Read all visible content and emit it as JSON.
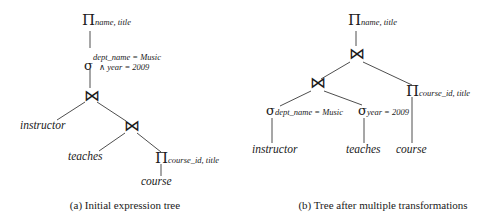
{
  "figure": {
    "background_color": "#ffffff",
    "ink_color": "#1a1a1a"
  },
  "trees": [
    {
      "id": "a",
      "caption": "(a) Initial expression tree",
      "nodes": [
        {
          "name": "project-name-title",
          "operator": "Π",
          "subscript": "name, title"
        },
        {
          "name": "select-conjunction",
          "operator": "σ",
          "subscript_line1": "dept_name = Music",
          "subscript_line2": "∧ year = 2009"
        },
        {
          "name": "join-upper",
          "operator": "⋈",
          "subscript": ""
        },
        {
          "name": "join-lower",
          "operator": "⋈",
          "subscript": ""
        },
        {
          "name": "relation-instructor",
          "label": "instructor"
        },
        {
          "name": "relation-teaches",
          "label": "teaches"
        },
        {
          "name": "project-course-id-title",
          "operator": "Π",
          "subscript": "course_id, title"
        },
        {
          "name": "relation-course",
          "label": "course"
        }
      ]
    },
    {
      "id": "b",
      "caption": "(b) Tree after multiple transformations",
      "nodes": [
        {
          "name": "project-name-title",
          "operator": "Π",
          "subscript": "name, title"
        },
        {
          "name": "join-upper",
          "operator": "⋈",
          "subscript": ""
        },
        {
          "name": "join-lower",
          "operator": "⋈",
          "subscript": ""
        },
        {
          "name": "select-dept-name",
          "operator": "σ",
          "subscript": "dept_name = Music"
        },
        {
          "name": "select-year",
          "operator": "σ",
          "subscript": "year = 2009"
        },
        {
          "name": "project-course-id-title",
          "operator": "Π",
          "subscript": "course_id, title"
        },
        {
          "name": "relation-instructor",
          "label": "instructor"
        },
        {
          "name": "relation-teaches",
          "label": "teaches"
        },
        {
          "name": "relation-course",
          "label": "course"
        }
      ]
    }
  ]
}
